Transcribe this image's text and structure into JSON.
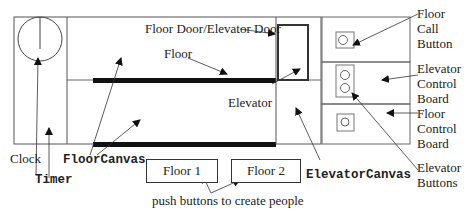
{
  "diagram": {
    "labels": {
      "floor_door": "Floor Door/Elevator Door",
      "floor": "Floor",
      "elevator": "Elevator",
      "clock": "Clock",
      "timer": "Timer",
      "floor_canvas": "FloorCanvas",
      "elevator_canvas": "ElevatorCanvas",
      "push_buttons_note": "push buttons to create people",
      "floor_call_button": [
        "Floor",
        "Call",
        "Button"
      ],
      "elevator_control_board": [
        "Elevator",
        "Control",
        "Board"
      ],
      "floor_control_board": [
        "Floor",
        "Control",
        "Board"
      ],
      "elevator_buttons": [
        "Elevator",
        "Buttons"
      ]
    },
    "buttons": {
      "floor1": "Floor 1",
      "floor2": "Floor 2"
    }
  }
}
